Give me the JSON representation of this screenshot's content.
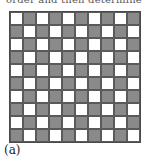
{
  "header": {
    "cut_text": "order and then determine the"
  },
  "figure": {
    "label": "(a)",
    "board": {
      "rows": 10,
      "cols": 10,
      "pattern": "checkerboard",
      "top_left": "light",
      "colors": {
        "light": "#ffffff",
        "dark": "#8a8a8a",
        "grid_line": "#5a5a5a"
      }
    }
  }
}
